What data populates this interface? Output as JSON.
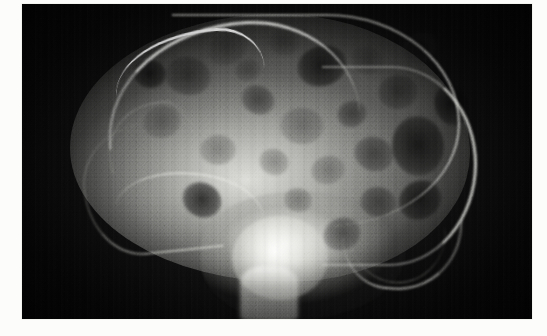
{
  "page": {
    "background_color": "#fcfcfa",
    "caption": ""
  },
  "figure": {
    "name": "lateral-skull-radiograph",
    "modality": "X-ray",
    "projection": "lateral",
    "body_part": "skull",
    "frame": {
      "x": 22,
      "y": 4,
      "width": 510,
      "height": 315
    },
    "film_background_color": "#0a0a0a",
    "bone_highlight_color": "#fffffc",
    "lesion_color": "#080808",
    "findings_visible": "multiple rounded lucent punched-out lesions throughout calvarium",
    "structures": [
      {
        "name": "frontal-bone-rim",
        "appearance": "bright dense arc",
        "region": "anterosuperior"
      },
      {
        "name": "vertex-calvarial-rim",
        "appearance": "bright arc",
        "region": "superior"
      },
      {
        "name": "occipital-rim",
        "appearance": "bright arc",
        "region": "posterior"
      },
      {
        "name": "skull-base",
        "appearance": "dense bright mass",
        "region": "inferior-central"
      },
      {
        "name": "sphenoid-sella-region",
        "appearance": "very bright blob",
        "region": "central-inferior"
      },
      {
        "name": "facial-orbital-lines",
        "appearance": "faint curved lines",
        "region": "anterior"
      },
      {
        "name": "mastoid-petrous",
        "appearance": "curved dense band",
        "region": "posteroinferior"
      },
      {
        "name": "cervical-column",
        "appearance": "bright vertical column",
        "region": "inferior-midline"
      }
    ],
    "lesions": [
      {
        "cx": 206,
        "cy": 44,
        "rx": 21,
        "ry": 16,
        "depth": "soft"
      },
      {
        "cx": 262,
        "cy": 38,
        "rx": 16,
        "ry": 13,
        "depth": "soft"
      },
      {
        "cx": 300,
        "cy": 62,
        "rx": 25,
        "ry": 20,
        "depth": "deep"
      },
      {
        "cx": 345,
        "cy": 56,
        "rx": 16,
        "ry": 14,
        "depth": "soft"
      },
      {
        "cx": 376,
        "cy": 88,
        "rx": 20,
        "ry": 17,
        "depth": "normal"
      },
      {
        "cx": 398,
        "cy": 44,
        "rx": 18,
        "ry": 15,
        "depth": "soft"
      },
      {
        "cx": 166,
        "cy": 72,
        "rx": 23,
        "ry": 19,
        "depth": "normal"
      },
      {
        "cx": 140,
        "cy": 118,
        "rx": 19,
        "ry": 16,
        "depth": "soft"
      },
      {
        "cx": 236,
        "cy": 96,
        "rx": 17,
        "ry": 14,
        "depth": "normal"
      },
      {
        "cx": 280,
        "cy": 122,
        "rx": 22,
        "ry": 18,
        "depth": "soft"
      },
      {
        "cx": 330,
        "cy": 110,
        "rx": 15,
        "ry": 13,
        "depth": "normal"
      },
      {
        "cx": 352,
        "cy": 150,
        "rx": 20,
        "ry": 17,
        "depth": "normal"
      },
      {
        "cx": 396,
        "cy": 142,
        "rx": 26,
        "ry": 30,
        "depth": "deep"
      },
      {
        "cx": 398,
        "cy": 196,
        "rx": 22,
        "ry": 19,
        "depth": "deep"
      },
      {
        "cx": 356,
        "cy": 198,
        "rx": 18,
        "ry": 15,
        "depth": "normal"
      },
      {
        "cx": 306,
        "cy": 166,
        "rx": 17,
        "ry": 14,
        "depth": "soft"
      },
      {
        "cx": 252,
        "cy": 158,
        "rx": 15,
        "ry": 13,
        "depth": "soft"
      },
      {
        "cx": 196,
        "cy": 146,
        "rx": 18,
        "ry": 15,
        "depth": "soft"
      },
      {
        "cx": 320,
        "cy": 230,
        "rx": 19,
        "ry": 16,
        "depth": "normal"
      },
      {
        "cx": 276,
        "cy": 196,
        "rx": 14,
        "ry": 12,
        "depth": "soft"
      },
      {
        "cx": 430,
        "cy": 100,
        "rx": 17,
        "ry": 22,
        "depth": "deep"
      },
      {
        "cx": 180,
        "cy": 196,
        "rx": 20,
        "ry": 17,
        "depth": "deep"
      },
      {
        "cx": 128,
        "cy": 70,
        "rx": 16,
        "ry": 14,
        "depth": "deep"
      },
      {
        "cx": 226,
        "cy": 66,
        "rx": 13,
        "ry": 11,
        "depth": "soft"
      }
    ]
  }
}
